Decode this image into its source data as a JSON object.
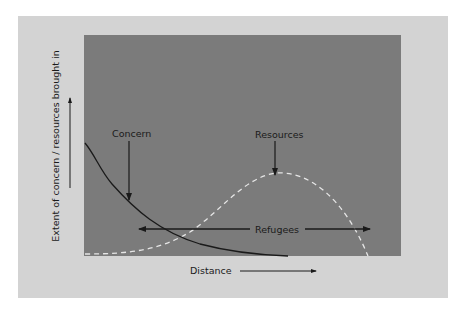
{
  "diagram": {
    "type": "conceptual-curve-diagram",
    "y_axis_label": "Extent of concern / resources brought in",
    "x_axis_label": "Distance",
    "annotations": {
      "concern": "Concern",
      "resources": "Resources",
      "refugees": "Refugees"
    },
    "curves": [
      {
        "name": "Concern",
        "style": "solid",
        "color": "#1a1a1a",
        "shape": "decreasing from high at short distance to near zero"
      },
      {
        "name": "Resources",
        "style": "dashed",
        "color": "#e6e6e6",
        "shape": "rises from near zero to a peak at mid distance, then falls"
      }
    ],
    "refugees_arrow": "double-headed horizontal arrow spanning distances",
    "colors": {
      "outer_panel": "#d3d3d3",
      "plot_area": "#7b7b7b",
      "text": "#1a1a1a",
      "dashed_curve": "#e6e6e6"
    }
  }
}
